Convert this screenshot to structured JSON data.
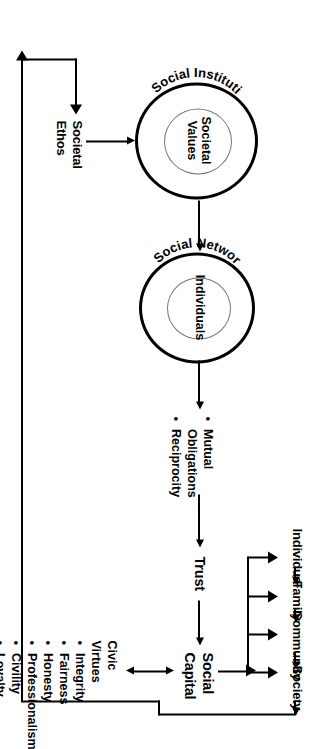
{
  "diagram": {
    "orientation": "rotated-90-ccw",
    "background": "#ffffff",
    "line_color": "#000000"
  },
  "nodes": {
    "societal_ethos": {
      "label": "Societal Ethos",
      "line1": "Societal",
      "line2": "Ethos"
    },
    "social_institutions": {
      "ring_label": "Social Institutions",
      "inner_label": "Societal Values",
      "inner_line1": "Societal",
      "inner_line2": "Values"
    },
    "social_networks": {
      "ring_label": "Social Networks",
      "inner_label": "Individuals",
      "inner_line1": "Individuals",
      "inner_line2": ""
    },
    "trust": {
      "label": "Trust"
    },
    "social_capital": {
      "label": "Social Capital",
      "line1": "Social",
      "line2": "Capital"
    }
  },
  "lists": {
    "obligations": {
      "items": [
        "Mutual Obligations",
        "Reciprocity"
      ],
      "item0_line1": "Mutual",
      "item0_line2": "Obligations",
      "item1_line1": "Reciprocity"
    },
    "civic_virtues": {
      "heading": "Civic Virtues",
      "heading_line1": "Civic",
      "heading_line2": "Virtues",
      "items": [
        "Integrity",
        "Fairness",
        "Honesty",
        "Professionalism",
        "Civility",
        "Loyalty"
      ]
    }
  },
  "chain": {
    "items": [
      "Individual",
      "Family",
      "Community",
      "Society"
    ]
  },
  "flows": {
    "ethos_to_institutions": "Societal Ethos to Social Institutions",
    "institutions_to_networks": "Social Institutions to Social Networks",
    "networks_to_obligations": "Social Networks to Mutual Obligations / Reciprocity",
    "obligations_to_trust": "Mutual Obligations / Reciprocity to Trust",
    "trust_to_social_capital": "Trust to Social Capital",
    "capital_virtues_bidirectional": "Social Capital to and from Civic Virtues",
    "capital_to_chain": "Social Capital distributed to Individual, Family, Community, Society",
    "feedback_loop": "Society feeds back to Societal Ethos"
  }
}
